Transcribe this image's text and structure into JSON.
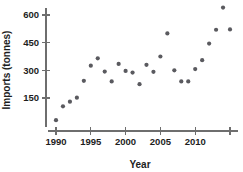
{
  "chart_data": {
    "type": "scatter",
    "title": "",
    "xlabel": "Year",
    "ylabel": "Imports (tonnes)",
    "xlim": [
      1989,
      2015.6
    ],
    "ylim": [
      0,
      670
    ],
    "grid": false,
    "legend": "none",
    "x_ticks": [
      1990,
      1995,
      2000,
      2005,
      2010,
      2015
    ],
    "x_tick_labels": [
      "1990",
      "1995",
      "2000",
      "2005",
      "2010",
      ""
    ],
    "y_ticks": [
      150,
      300,
      450,
      600
    ],
    "y_tick_labels": [
      "150",
      "300",
      "450",
      "600"
    ],
    "marker_color": "#5a5a5f",
    "axis_color": "#6e6e6e",
    "x": [
      1990,
      1991,
      1992,
      1993,
      1994,
      1995,
      1996,
      1997,
      1998,
      1999,
      2000,
      2001,
      2002,
      2003,
      2004,
      2005,
      2006,
      2007,
      2008,
      2009,
      2010,
      2011,
      2012,
      2013,
      2014,
      2015
    ],
    "y": [
      30,
      105,
      130,
      152,
      243,
      325,
      365,
      293,
      240,
      335,
      297,
      288,
      225,
      330,
      292,
      375,
      500,
      300,
      240,
      240,
      307,
      355,
      445,
      520,
      640,
      522
    ],
    "points": [
      {
        "year": 1990,
        "imports": 30
      },
      {
        "year": 1991,
        "imports": 105
      },
      {
        "year": 1992,
        "imports": 130
      },
      {
        "year": 1993,
        "imports": 152
      },
      {
        "year": 1994,
        "imports": 243
      },
      {
        "year": 1995,
        "imports": 325
      },
      {
        "year": 1996,
        "imports": 365
      },
      {
        "year": 1997,
        "imports": 293
      },
      {
        "year": 1998,
        "imports": 240
      },
      {
        "year": 1999,
        "imports": 335
      },
      {
        "year": 2000,
        "imports": 297
      },
      {
        "year": 2001,
        "imports": 288
      },
      {
        "year": 2002,
        "imports": 225
      },
      {
        "year": 2003,
        "imports": 330
      },
      {
        "year": 2004,
        "imports": 292
      },
      {
        "year": 2005,
        "imports": 375
      },
      {
        "year": 2006,
        "imports": 500
      },
      {
        "year": 2007,
        "imports": 300
      },
      {
        "year": 2008,
        "imports": 240
      },
      {
        "year": 2009,
        "imports": 240
      },
      {
        "year": 2010,
        "imports": 307
      },
      {
        "year": 2011,
        "imports": 355
      },
      {
        "year": 2012,
        "imports": 445
      },
      {
        "year": 2013,
        "imports": 520
      },
      {
        "year": 2014,
        "imports": 640
      },
      {
        "year": 2015,
        "imports": 522
      }
    ]
  }
}
